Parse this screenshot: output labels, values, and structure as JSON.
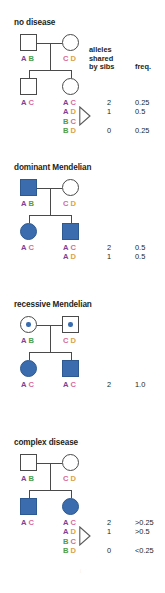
{
  "figure": {
    "alleles": {
      "A": {
        "letter": "A",
        "color": "#7d3f98"
      },
      "B": {
        "letter": "B",
        "color": "#4e9d45"
      },
      "C": {
        "letter": "C",
        "color": "#d46a9b"
      },
      "D": {
        "letter": "D",
        "color": "#e0a33e"
      }
    },
    "affected_color": "#3a6cae",
    "outline_color": "#4a4a4a",
    "column_headers": {
      "alleles_line1": "alleles",
      "alleles_line2": "shared",
      "alleles_line3": "by sibs",
      "freq": "freq."
    },
    "watermark": "i"
  },
  "panels": [
    {
      "title": "no disease",
      "father": {
        "sex": "male",
        "status": "unaffected",
        "genotype": [
          "A",
          "B"
        ]
      },
      "mother": {
        "sex": "female",
        "status": "unaffected",
        "genotype": [
          "C",
          "D"
        ]
      },
      "children": [
        {
          "sex": "male",
          "status": "unaffected",
          "genotype": [
            "A",
            "C"
          ]
        },
        {
          "sex": "female",
          "status": "unaffected",
          "genotype": [
            "A",
            "C"
          ]
        }
      ],
      "has_headers": true,
      "sib_table": [
        {
          "genotype": [
            "A",
            "C"
          ],
          "shared": "2",
          "freq": "0.25"
        },
        {
          "genotype": [
            "A",
            "D"
          ],
          "shared": "1",
          "freq": "0.5"
        },
        {
          "genotype": [
            "B",
            "C"
          ],
          "shared": "",
          "freq": ""
        },
        {
          "genotype": [
            "B",
            "D"
          ],
          "shared": "0",
          "freq": "0.25"
        }
      ],
      "bracket": true
    },
    {
      "title": "dominant Mendelian",
      "father": {
        "sex": "male",
        "status": "affected",
        "genotype": [
          "A",
          "B"
        ]
      },
      "mother": {
        "sex": "female",
        "status": "unaffected",
        "genotype": [
          "C",
          "D"
        ]
      },
      "children": [
        {
          "sex": "female",
          "status": "affected",
          "genotype": [
            "A",
            "C"
          ]
        },
        {
          "sex": "male",
          "status": "affected",
          "genotype": [
            "A",
            "C"
          ]
        }
      ],
      "has_headers": false,
      "sib_table": [
        {
          "genotype": [
            "A",
            "C"
          ],
          "shared": "2",
          "freq": "0.5"
        },
        {
          "genotype": [
            "A",
            "D"
          ],
          "shared": "1",
          "freq": "0.5"
        }
      ],
      "bracket": false
    },
    {
      "title": "recessive Mendelian",
      "father": {
        "sex": "female",
        "status": "carrier",
        "genotype": [
          "A",
          "B"
        ]
      },
      "mother": {
        "sex": "male",
        "status": "carrier",
        "genotype": [
          "C",
          "D"
        ]
      },
      "children": [
        {
          "sex": "female",
          "status": "affected",
          "genotype": [
            "A",
            "C"
          ]
        },
        {
          "sex": "male",
          "status": "affected",
          "genotype": [
            "A",
            "C"
          ]
        }
      ],
      "has_headers": false,
      "sib_table": [
        {
          "genotype": [
            "A",
            "C"
          ],
          "shared": "2",
          "freq": "1.0"
        }
      ],
      "bracket": false
    },
    {
      "title": "complex disease",
      "father": {
        "sex": "male",
        "status": "unaffected",
        "genotype": [
          "A",
          "B"
        ]
      },
      "mother": {
        "sex": "female",
        "status": "unaffected",
        "genotype": [
          "C",
          "D"
        ]
      },
      "children": [
        {
          "sex": "male",
          "status": "affected",
          "genotype": [
            "A",
            "C"
          ]
        },
        {
          "sex": "female",
          "status": "affected",
          "genotype": [
            "A",
            "C"
          ]
        }
      ],
      "has_headers": false,
      "sib_table": [
        {
          "genotype": [
            "A",
            "C"
          ],
          "shared": "2",
          "freq": ">0.25"
        },
        {
          "genotype": [
            "A",
            "D"
          ],
          "shared": "1",
          "freq": ">0.5"
        },
        {
          "genotype": [
            "B",
            "C"
          ],
          "shared": "",
          "freq": ""
        },
        {
          "genotype": [
            "B",
            "D"
          ],
          "shared": "0",
          "freq": "<0.25"
        }
      ],
      "bracket": true
    }
  ]
}
